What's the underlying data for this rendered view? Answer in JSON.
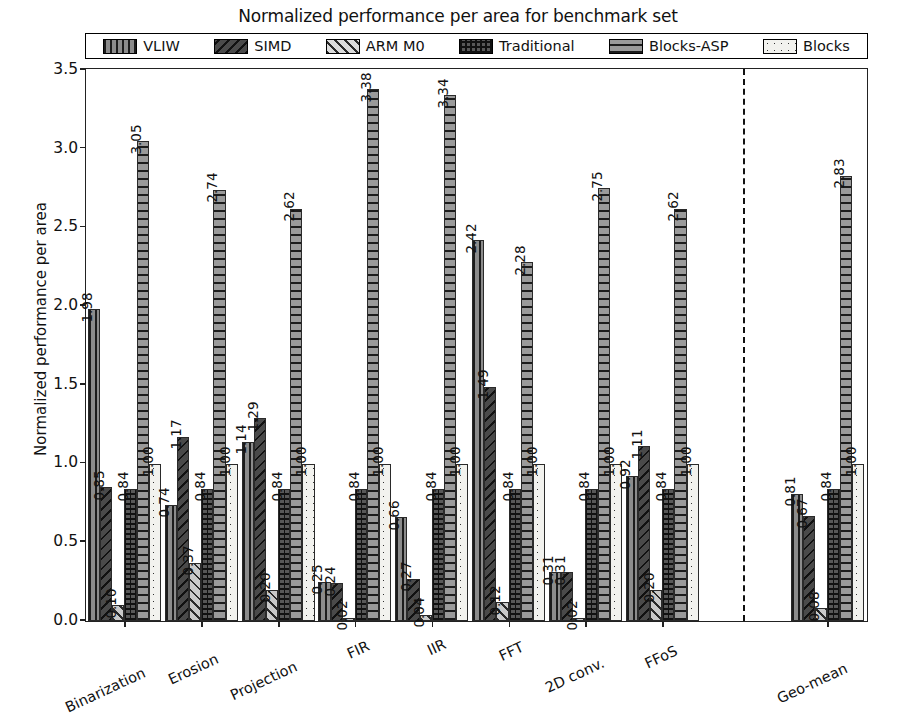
{
  "chart_data": {
    "type": "bar",
    "title": "Normalized performance per area for benchmark set",
    "xlabel": "",
    "ylabel": "Normalized performance per area",
    "ylim": [
      0,
      3.5
    ],
    "yticks": [
      "0.0",
      "0.5",
      "1.0",
      "1.5",
      "2.0",
      "2.5",
      "3.0",
      "3.5"
    ],
    "grid": false,
    "legend_position": "top-inside",
    "clip_note": "Bars above 3.5 are clipped and marked with an up-arrow annotation",
    "categories": [
      "Binarization",
      "Erosion",
      "Projection",
      "FIR",
      "IIR",
      "FFT",
      "2D conv.",
      "FFoS",
      "Geo-mean"
    ],
    "separator_after_category": "FFoS",
    "series": [
      {
        "name": "VLIW",
        "values": [
          1.98,
          0.74,
          1.14,
          0.25,
          0.66,
          2.42,
          0.31,
          0.92,
          0.81
        ]
      },
      {
        "name": "SIMD",
        "values": [
          0.85,
          1.17,
          1.29,
          0.24,
          0.27,
          1.49,
          0.31,
          1.11,
          0.67
        ]
      },
      {
        "name": "ARM M0",
        "values": [
          0.1,
          0.37,
          0.2,
          0.02,
          0.04,
          0.12,
          0.02,
          0.2,
          0.08
        ]
      },
      {
        "name": "Traditional",
        "values": [
          0.84,
          0.84,
          0.84,
          0.84,
          0.84,
          0.84,
          0.84,
          0.84,
          0.84
        ]
      },
      {
        "name": "Blocks-ASP",
        "values": [
          3.05,
          2.74,
          2.62,
          3.38,
          3.34,
          2.28,
          2.75,
          2.62,
          2.83
        ]
      },
      {
        "name": "Blocks",
        "values": [
          1.0,
          1.0,
          1.0,
          1.0,
          1.0,
          1.0,
          1.0,
          1.0,
          1.0
        ]
      }
    ],
    "value_labels": [
      [
        "1.98",
        "0.85",
        "0.10",
        "0.84",
        "3.05",
        "1.00"
      ],
      [
        "0.74",
        "1.17",
        "0.37",
        "0.84",
        "2.74",
        "1.00"
      ],
      [
        "1.14",
        "1.29",
        "0.20",
        "0.84",
        "2.62",
        "1.00"
      ],
      [
        "0.25",
        "0.24",
        "0.02",
        "0.84",
        "3.38",
        "1.00"
      ],
      [
        "0.66",
        "0.27",
        "0.04",
        "0.84",
        "3.34",
        "1.00"
      ],
      [
        "2.42",
        "1.49",
        "0.12",
        "0.84",
        "2.28",
        "1.00"
      ],
      [
        "0.31",
        "0.31",
        "0.02",
        "0.84",
        "2.75",
        "1.00"
      ],
      [
        "0.92",
        "1.11",
        "0.20",
        "0.84",
        "2.62",
        "1.00"
      ],
      [
        "0.81",
        "0.67",
        "0.08",
        "0.84",
        "2.83",
        "1.00"
      ]
    ],
    "clipped": [
      {
        "category": "FIR",
        "series": "Blocks-ASP",
        "value": 3.38
      },
      {
        "category": "IIR",
        "series": "Blocks-ASP",
        "value": 3.34
      }
    ]
  },
  "legend": {
    "items": [
      {
        "label": "VLIW",
        "icon": "hatch-vertical-swatch",
        "fill": "#8c8c8c"
      },
      {
        "label": "SIMD",
        "icon": "hatch-backslash-swatch",
        "fill": "#4a4a4a"
      },
      {
        "label": "ARM M0",
        "icon": "hatch-slash-swatch",
        "fill": "#dcdcdc"
      },
      {
        "label": "Traditional",
        "icon": "hatch-grid-swatch",
        "fill": "#585858"
      },
      {
        "label": "Blocks-ASP",
        "icon": "hatch-horizontal-swatch",
        "fill": "#9a9a9a"
      },
      {
        "label": "Blocks",
        "icon": "hatch-dotted-swatch",
        "fill": "#f2f2ee"
      }
    ]
  },
  "colors": {
    "axis": "#222222",
    "text": "#111111",
    "background": "#ffffff",
    "divider": "#111111"
  },
  "clip_marker": "↑"
}
